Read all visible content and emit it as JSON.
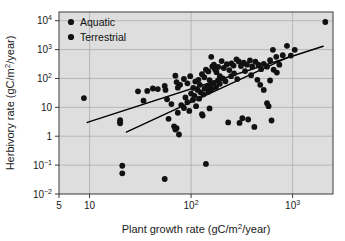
{
  "chart_data": {
    "type": "scatter",
    "title": "",
    "xlabel": "Plant growth rate (gC/m²/year)",
    "ylabel": "Herbivory rate (gC/m²/year)",
    "xscale": "log",
    "yscale": "log",
    "xlim": [
      5,
      2500
    ],
    "ylim": [
      0.01,
      20000
    ],
    "grid": true,
    "legend_position": "top-left",
    "xticks": [
      {
        "value": 5,
        "label": "5"
      },
      {
        "value": 10,
        "label": "10"
      },
      {
        "value": 100,
        "label": "10²"
      },
      {
        "value": 1000,
        "label": "10³"
      }
    ],
    "yticks": [
      {
        "value": 0.01,
        "label": "10⁻²"
      },
      {
        "value": 0.1,
        "label": "10⁻¹"
      },
      {
        "value": 1,
        "label": "1"
      },
      {
        "value": 10,
        "label": "10"
      },
      {
        "value": 100,
        "label": "10²"
      },
      {
        "value": 1000,
        "label": "10³"
      },
      {
        "value": 10000,
        "label": "10⁴"
      }
    ],
    "series": [
      {
        "name": "Aquatic",
        "marker": "circle",
        "color": "#111111",
        "points": [
          [
            8.8,
            21
          ],
          [
            30,
            36
          ],
          [
            37,
            37
          ],
          [
            42,
            45
          ],
          [
            47,
            43
          ],
          [
            55,
            55
          ],
          [
            56,
            40
          ],
          [
            58,
            19
          ],
          [
            70,
            125
          ],
          [
            72,
            75
          ],
          [
            74,
            48
          ],
          [
            78,
            60
          ],
          [
            85,
            96
          ],
          [
            92,
            68
          ],
          [
            98,
            120
          ],
          [
            105,
            47
          ],
          [
            110,
            78
          ],
          [
            118,
            90
          ],
          [
            122,
            60
          ],
          [
            128,
            140
          ],
          [
            135,
            110
          ],
          [
            140,
            200
          ],
          [
            148,
            175
          ],
          [
            152,
            88
          ],
          [
            158,
            560
          ],
          [
            162,
            260
          ],
          [
            168,
            300
          ],
          [
            172,
            210
          ],
          [
            178,
            165
          ],
          [
            185,
            250
          ],
          [
            192,
            120
          ],
          [
            200,
            400
          ],
          [
            210,
            230
          ],
          [
            225,
            310
          ],
          [
            238,
            195
          ],
          [
            250,
            330
          ],
          [
            262,
            280
          ],
          [
            280,
            460
          ],
          [
            295,
            390
          ],
          [
            310,
            270
          ],
          [
            330,
            350
          ],
          [
            355,
            300
          ],
          [
            380,
            420
          ],
          [
            400,
            260
          ],
          [
            430,
            380
          ],
          [
            460,
            300
          ],
          [
            490,
            210
          ],
          [
            520,
            320
          ],
          [
            560,
            255
          ],
          [
            600,
            430
          ],
          [
            640,
            980
          ],
          [
            690,
            560
          ],
          [
            740,
            300
          ],
          [
            800,
            640
          ],
          [
            880,
            1350
          ],
          [
            960,
            620
          ],
          [
            1050,
            980
          ],
          [
            2100,
            9000
          ]
        ]
      },
      {
        "name": "Terrestrial",
        "marker": "circle",
        "color": "#111111",
        "points": [
          [
            20,
            3.2
          ],
          [
            20,
            2.8
          ],
          [
            20,
            3.6
          ],
          [
            21,
            0.095
          ],
          [
            21,
            0.052
          ],
          [
            34,
            17
          ],
          [
            55,
            0.033
          ],
          [
            60,
            4.0
          ],
          [
            64,
            13
          ],
          [
            68,
            2.2
          ],
          [
            70,
            1.7
          ],
          [
            72,
            1.9
          ],
          [
            74,
            6.5
          ],
          [
            76,
            1.15
          ],
          [
            80,
            12
          ],
          [
            85,
            9.5
          ],
          [
            88,
            22
          ],
          [
            92,
            15
          ],
          [
            96,
            7.5
          ],
          [
            100,
            30
          ],
          [
            104,
            18
          ],
          [
            108,
            25
          ],
          [
            112,
            11
          ],
          [
            116,
            40
          ],
          [
            120,
            20
          ],
          [
            124,
            33
          ],
          [
            128,
            5.8
          ],
          [
            130,
            5.2
          ],
          [
            132,
            28
          ],
          [
            136,
            45
          ],
          [
            140,
            0.11
          ],
          [
            144,
            52
          ],
          [
            148,
            35
          ],
          [
            152,
            9.2
          ],
          [
            156,
            60
          ],
          [
            160,
            42
          ],
          [
            168,
            70
          ],
          [
            176,
            50
          ],
          [
            184,
            85
          ],
          [
            192,
            65
          ],
          [
            205,
            100
          ],
          [
            218,
            80
          ],
          [
            232,
            3.0
          ],
          [
            248,
            120
          ],
          [
            265,
            150
          ],
          [
            285,
            95
          ],
          [
            300,
            2.9
          ],
          [
            320,
            4.2
          ],
          [
            340,
            180
          ],
          [
            365,
            3.8
          ],
          [
            390,
            130
          ],
          [
            420,
            2.1
          ],
          [
            450,
            90
          ],
          [
            480,
            60
          ],
          [
            520,
            40
          ],
          [
            560,
            14
          ],
          [
            580,
            11
          ],
          [
            600,
            85
          ],
          [
            620,
            3.5
          ],
          [
            650,
            200
          ],
          [
            700,
            160
          ]
        ]
      }
    ],
    "trend_lines": [
      {
        "name": "aquatic-fit",
        "x1": 9.5,
        "y1": 3.0,
        "x2": 2000,
        "y2": 1300
      },
      {
        "name": "terrestrial-fit",
        "x1": 23,
        "y1": 1.4,
        "x2": 1000,
        "y2": 640
      }
    ]
  },
  "legend": {
    "items": [
      {
        "label": "Aquatic"
      },
      {
        "label": "Terrestrial"
      }
    ]
  }
}
